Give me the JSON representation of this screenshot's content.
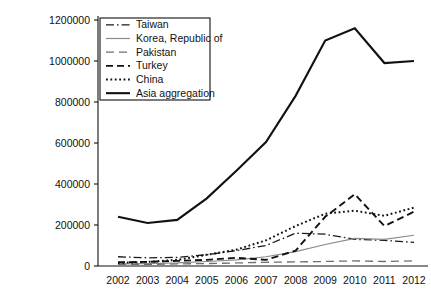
{
  "chart_data": {
    "type": "line",
    "title": "",
    "xlabel": "",
    "ylabel": "",
    "x": [
      2002,
      2003,
      2004,
      2005,
      2006,
      2007,
      2008,
      2009,
      2010,
      2011,
      2012
    ],
    "categories": [
      "2002",
      "2003",
      "2004",
      "2005",
      "2006",
      "2007",
      "2008",
      "2009",
      "2010",
      "2011",
      "2012"
    ],
    "xlim": [
      2002,
      2012
    ],
    "ylim": [
      0,
      1200000
    ],
    "yticks": [
      0,
      200000,
      400000,
      600000,
      800000,
      1000000,
      1200000
    ],
    "ytick_labels": [
      "0",
      "200000",
      "400000",
      "600000",
      "800000",
      "1000000",
      "1200000"
    ],
    "grid": false,
    "legend_position": "upper-left",
    "series": [
      {
        "name": "Taiwan",
        "style": "dash-dot",
        "color": "#1a1a1a",
        "width": 1.3,
        "values": [
          45000,
          40000,
          42000,
          55000,
          75000,
          100000,
          160000,
          155000,
          130000,
          125000,
          115000
        ]
      },
      {
        "name": "Korea, Republic of",
        "style": "solid-thin",
        "color": "#8a8a8a",
        "width": 1.2,
        "values": [
          10000,
          12000,
          15000,
          22000,
          30000,
          45000,
          70000,
          105000,
          135000,
          130000,
          150000
        ]
      },
      {
        "name": "Pakistan",
        "style": "long-dash",
        "color": "#6e6e6e",
        "width": 1.3,
        "values": [
          8000,
          8000,
          10000,
          12000,
          15000,
          18000,
          20000,
          22000,
          25000,
          22000,
          25000
        ]
      },
      {
        "name": "Turkey",
        "style": "dashed",
        "color": "#111111",
        "width": 1.9,
        "values": [
          18000,
          20000,
          25000,
          30000,
          40000,
          30000,
          75000,
          240000,
          350000,
          195000,
          265000
        ]
      },
      {
        "name": "China",
        "style": "dotted",
        "color": "#111111",
        "width": 2.0,
        "values": [
          15000,
          20000,
          30000,
          55000,
          80000,
          125000,
          195000,
          255000,
          270000,
          245000,
          285000
        ]
      },
      {
        "name": "Asia aggregation",
        "style": "solid",
        "color": "#111111",
        "width": 2.1,
        "values": [
          240000,
          210000,
          225000,
          330000,
          465000,
          605000,
          830000,
          1100000,
          1160000,
          990000,
          1000000
        ]
      }
    ]
  },
  "legend": {
    "entries": [
      {
        "label": "Taiwan"
      },
      {
        "label": "Korea, Republic of"
      },
      {
        "label": "Pakistan"
      },
      {
        "label": "Turkey"
      },
      {
        "label": "China"
      },
      {
        "label": "Asia aggregation"
      }
    ]
  }
}
